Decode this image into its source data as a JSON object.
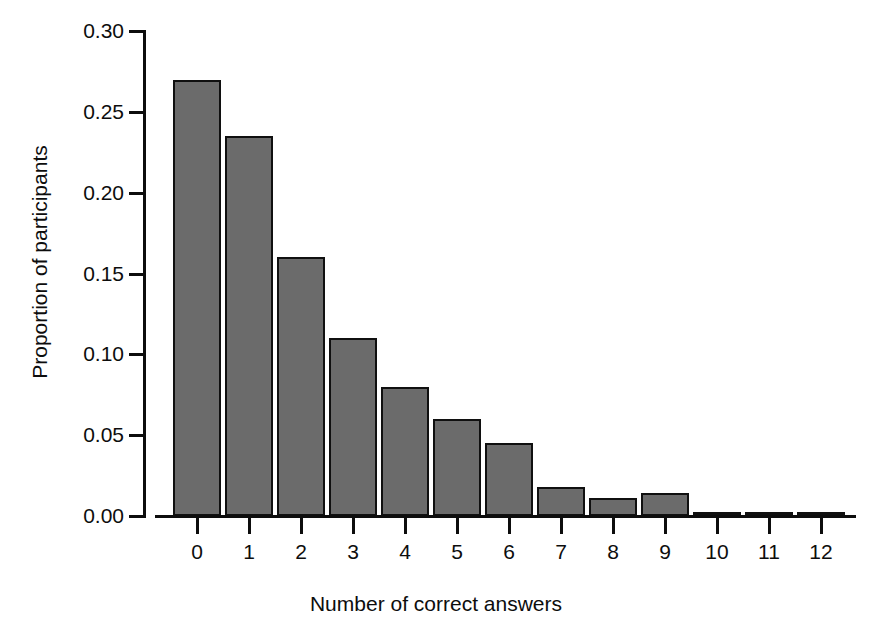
{
  "chart_data": {
    "type": "bar",
    "title": "",
    "subtitle": "",
    "xlabel": "Number of correct answers",
    "ylabel": "Proportion of participants",
    "categories": [
      "0",
      "1",
      "2",
      "3",
      "4",
      "5",
      "6",
      "7",
      "8",
      "9",
      "10",
      "11",
      "12"
    ],
    "values": [
      0.27,
      0.235,
      0.16,
      0.11,
      0.08,
      0.06,
      0.045,
      0.018,
      0.011,
      0.014,
      0.001,
      0.002,
      0.0005
    ],
    "series": [
      {
        "name": "Proportion of participants",
        "values": [
          0.27,
          0.235,
          0.16,
          0.11,
          0.08,
          0.06,
          0.045,
          0.018,
          0.011,
          0.014,
          0.001,
          0.002,
          0.0005
        ]
      }
    ],
    "ylim": [
      0.0,
      0.3
    ],
    "ytick_labels": [
      "0.00",
      "0.05",
      "0.10",
      "0.15",
      "0.20",
      "0.25",
      "0.30"
    ],
    "ytick_values": [
      0.0,
      0.05,
      0.1,
      0.15,
      0.2,
      0.25,
      0.3
    ],
    "xtick_labels": [
      "0",
      "1",
      "2",
      "3",
      "4",
      "5",
      "6",
      "7",
      "8",
      "9",
      "10",
      "11",
      "12"
    ],
    "grid": false,
    "legend": false,
    "legend_position": "none",
    "bar_fill_color": "#6b6b6b",
    "bar_border_color": "#101010",
    "axis_color": "#0d0d0d",
    "background_color": "#ffffff"
  }
}
